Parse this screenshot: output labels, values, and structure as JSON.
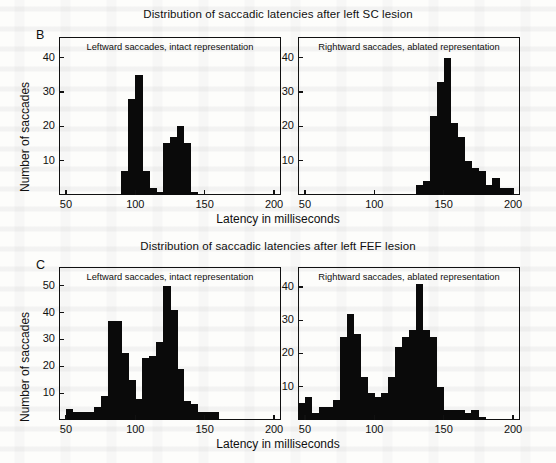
{
  "figure": {
    "xlabel": "Latency in milliseconds",
    "ylabel": "Number of saccades"
  },
  "panels": [
    {
      "letter": "B",
      "title": "Distribution of saccadic latencies after left SC lesion",
      "left": {
        "caption": "Leftward saccades, intact representation",
        "yticks": [
          10,
          20,
          30,
          40
        ],
        "xticks": [
          50,
          100,
          150,
          200
        ]
      },
      "right": {
        "caption": "Rightward saccades, ablated representation",
        "yticks": [
          10,
          20,
          30,
          40
        ],
        "xticks": [
          50,
          100,
          150,
          200
        ]
      }
    },
    {
      "letter": "C",
      "title": "Distribution of saccadic latencies after left FEF lesion",
      "left": {
        "caption": "Leftward saccades, intact representation",
        "yticks": [
          10,
          20,
          30,
          40,
          50
        ],
        "xticks": [
          50,
          100,
          150,
          200
        ]
      },
      "right": {
        "caption": "Rightward saccades, ablated representation",
        "yticks": [
          10,
          20,
          30,
          40
        ],
        "xticks": [
          50,
          100,
          150,
          200
        ]
      }
    }
  ],
  "chart_data": [
    {
      "type": "bar",
      "id": "B-left",
      "title": "Leftward saccades, intact representation",
      "panel": "B",
      "xlabel": "Latency in milliseconds",
      "ylabel": "Number of saccades",
      "xlim": [
        45,
        205
      ],
      "ylim": [
        0,
        46
      ],
      "bin_width": 5,
      "grid": false,
      "legend": "none",
      "bin_starts": [
        90,
        95,
        100,
        105,
        110,
        115,
        120,
        125,
        130,
        135,
        140
      ],
      "values": [
        7,
        28,
        35,
        7,
        2,
        1,
        15,
        17,
        20,
        15,
        1
      ]
    },
    {
      "type": "bar",
      "id": "B-right",
      "title": "Rightward saccades, ablated representation",
      "panel": "B",
      "xlabel": "Latency in milliseconds",
      "ylabel": "Number of saccades",
      "xlim": [
        45,
        205
      ],
      "ylim": [
        0,
        46
      ],
      "bin_width": 5,
      "grid": false,
      "legend": "none",
      "bin_starts": [
        130,
        135,
        140,
        145,
        150,
        155,
        160,
        165,
        170,
        175,
        180,
        185,
        190,
        195
      ],
      "values": [
        3,
        4,
        23,
        33,
        40,
        21,
        17,
        10,
        8,
        7,
        3,
        5,
        2,
        2
      ]
    },
    {
      "type": "bar",
      "id": "C-left",
      "title": "Leftward saccades, intact representation",
      "panel": "C",
      "xlabel": "Latency in milliseconds",
      "ylabel": "Number of saccades",
      "xlim": [
        45,
        205
      ],
      "ylim": [
        0,
        57
      ],
      "bin_width": 5,
      "grid": false,
      "legend": "none",
      "bin_starts": [
        50,
        55,
        60,
        65,
        70,
        75,
        80,
        85,
        90,
        95,
        100,
        105,
        110,
        115,
        120,
        125,
        130,
        135,
        140,
        145,
        150,
        155
      ],
      "values": [
        4,
        3,
        3,
        3,
        5,
        9,
        37,
        37,
        25,
        15,
        8,
        23,
        24,
        29,
        50,
        41,
        19,
        7,
        6,
        3,
        3,
        3
      ]
    },
    {
      "type": "bar",
      "id": "C-right",
      "title": "Rightward saccades, ablated representation",
      "panel": "C",
      "xlabel": "Latency in milliseconds",
      "ylabel": "Number of saccades",
      "xlim": [
        45,
        205
      ],
      "ylim": [
        0,
        46
      ],
      "bin_width": 5,
      "grid": false,
      "legend": "none",
      "bin_starts": [
        45,
        50,
        55,
        60,
        65,
        70,
        75,
        80,
        85,
        90,
        95,
        100,
        105,
        110,
        115,
        120,
        125,
        130,
        135,
        140,
        145,
        150,
        155,
        160,
        165,
        170,
        175
      ],
      "values": [
        5,
        7,
        2,
        4,
        4,
        6,
        25,
        32,
        26,
        13,
        8,
        7,
        8,
        13,
        22,
        25,
        27,
        41,
        27,
        25,
        10,
        3,
        3,
        3,
        2,
        3,
        1
      ]
    }
  ],
  "colors": {
    "bar": "#0a0a0a",
    "axis": "#111111",
    "page": "#fdfdfb"
  }
}
